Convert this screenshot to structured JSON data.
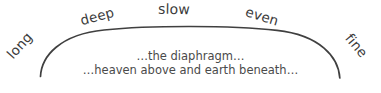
{
  "figure": {
    "background_color": "#ffffff",
    "stroke_color": "#404040",
    "label_color": "#3b3b3b",
    "caption_color": "#4a4a4a"
  },
  "arc": {
    "name": "breath-arc",
    "description": "wide shallow upward arc with downturned ends"
  },
  "arc_labels": [
    {
      "text": "long",
      "rotation": -48
    },
    {
      "text": "deep",
      "rotation": -15
    },
    {
      "text": "slow",
      "rotation": 1
    },
    {
      "text": "even",
      "rotation": 17
    },
    {
      "text": "fine",
      "rotation": 50
    }
  ],
  "caption": {
    "line1": "…the diaphragm…",
    "line2": "…heaven above and earth beneath…"
  }
}
